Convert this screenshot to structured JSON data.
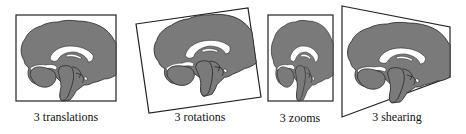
{
  "figure": {
    "colors": {
      "brain_fill": "#7a7a7a",
      "brain_outline": "#2a2a2a",
      "ventricle": "#ffffff",
      "frame": "#222222",
      "background": "#ffffff"
    },
    "panels": [
      {
        "id": "translations",
        "label": "3 translations",
        "label_x": 66,
        "label_y": 110
      },
      {
        "id": "rotations",
        "label": "3 rotations",
        "label_x": 200,
        "label_y": 110
      },
      {
        "id": "zooms",
        "label": "3 zooms",
        "label_x": 300,
        "label_y": 111
      },
      {
        "id": "shearing",
        "label": "3 shearing",
        "label_x": 397,
        "label_y": 110
      }
    ]
  }
}
